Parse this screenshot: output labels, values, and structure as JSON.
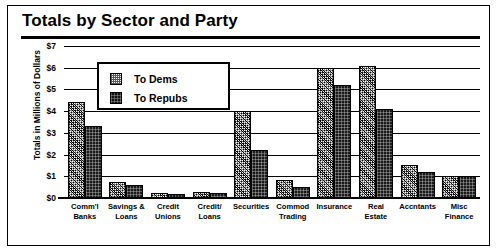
{
  "chart_data": {
    "type": "bar",
    "title": "Totals by Sector and Party",
    "xlabel": "",
    "ylabel": "Totals in Millions of Dollars",
    "ylim": [
      0,
      7
    ],
    "ytick_labels": [
      "$7",
      "$6",
      "$5",
      "$4",
      "$3",
      "$2",
      "$1",
      "$0"
    ],
    "ytick_values": [
      7,
      6,
      5,
      4,
      3,
      2,
      1,
      0
    ],
    "grid": true,
    "legend_position": "upper-left-inset",
    "categories": [
      "Comm'l Banks",
      "Savings & Loans",
      "Credit Unions",
      "Credit/ Loans",
      "Securities",
      "Commod Trading",
      "Insurance",
      "Real Estate",
      "Accntants",
      "Misc Finance"
    ],
    "category_lines": [
      [
        "Comm'l",
        "Banks"
      ],
      [
        "Savings &",
        "Loans"
      ],
      [
        "Credit",
        "Unions"
      ],
      [
        "Credit/",
        "Loans"
      ],
      [
        "Securities",
        ""
      ],
      [
        "Commod",
        "Trading"
      ],
      [
        "Insurance",
        ""
      ],
      [
        "Real",
        "Estate"
      ],
      [
        "Accntants",
        ""
      ],
      [
        "Misc",
        "Finance"
      ]
    ],
    "series": [
      {
        "name": "To Dems",
        "values": [
          4.4,
          0.75,
          0.25,
          0.3,
          4.0,
          0.85,
          6.0,
          6.1,
          1.5,
          1.0
        ]
      },
      {
        "name": "To Repubs",
        "values": [
          3.3,
          0.6,
          0.2,
          0.25,
          2.2,
          0.5,
          5.2,
          4.1,
          1.2,
          1.0
        ]
      }
    ]
  },
  "legend": {
    "items": [
      {
        "label": "To Dems",
        "key": "dems"
      },
      {
        "label": "To Repubs",
        "key": "repubs"
      }
    ]
  }
}
